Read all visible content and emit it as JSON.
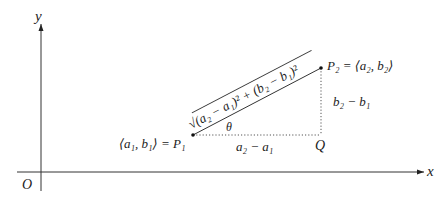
{
  "diagram": {
    "axes": {
      "x_label": "x",
      "y_label": "y",
      "origin_label": "O"
    },
    "points": {
      "p1": {
        "label": "⟨a₁, b₁⟩ = P₁"
      },
      "p2": {
        "label": "P₂ = ⟨a₂, b₂⟩"
      },
      "q": {
        "label": "Q"
      }
    },
    "segments": {
      "horizontal_label": "a₂ − a₁",
      "vertical_label": "b₂ − b₁",
      "hypotenuse_label": "√(a₂ − a₁)² + (b₂ − b₁)²",
      "angle_label": "θ"
    },
    "colors": {
      "ink": "#222222",
      "background": "#ffffff"
    }
  }
}
